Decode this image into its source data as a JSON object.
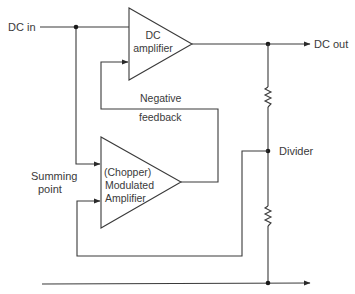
{
  "diagram": {
    "inputs": {
      "dc_in": "DC in"
    },
    "outputs": {
      "dc_out": "DC out"
    },
    "blocks": {
      "dc_amplifier": {
        "line1": "DC",
        "line2": "amplifier"
      },
      "chopper_amplifier": {
        "line1": "(Chopper)",
        "line2": "Modulated",
        "line3": "Amplifier"
      }
    },
    "labels": {
      "negative_feedback_1": "Negative",
      "negative_feedback_2": "feedback",
      "summing_point_1": "Summing",
      "summing_point_2": "point",
      "divider": "Divider"
    },
    "components": [
      "resistor-upper",
      "resistor-lower"
    ],
    "colors": {
      "line": "#3a3a3a",
      "background": "#ffffff"
    }
  }
}
